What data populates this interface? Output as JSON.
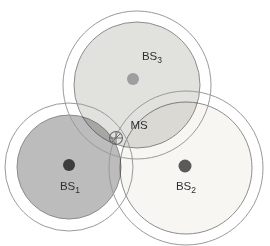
{
  "diagram": {
    "background": "#ffffff",
    "stations": [
      {
        "name": "BS1",
        "label_main": "BS",
        "label_sub": "1",
        "cx": 69,
        "cy": 167,
        "r_inner": 52,
        "r_outer": 64,
        "fill": "#bcbcbc",
        "dot": {
          "cx": 69,
          "cy": 165,
          "r": 6,
          "color": "#3d3d3d"
        },
        "label": {
          "x": 70,
          "y": 190
        }
      },
      {
        "name": "BS2",
        "label_main": "BS",
        "label_sub": "2",
        "cx": 186,
        "cy": 168,
        "r_inner": 66,
        "r_outer": 77,
        "fill": "#f7f6f3",
        "dot": {
          "cx": 185,
          "cy": 166,
          "r": 6.5,
          "color": "#5a5a5a"
        },
        "label": {
          "x": 186,
          "y": 190
        }
      },
      {
        "name": "BS3",
        "label_main": "BS",
        "label_sub": "3",
        "cx": 137,
        "cy": 85,
        "r_inner": 63,
        "r_outer": 74,
        "fill": "#e1e1de",
        "dot": {
          "cx": 133,
          "cy": 79,
          "r": 6,
          "color": "#9e9e9e"
        },
        "label": {
          "x": 152,
          "y": 60
        }
      }
    ],
    "mobile_station": {
      "label": "MS",
      "marker": {
        "cx": 116,
        "cy": 138,
        "r": 6.5,
        "color": "#6b6b6b"
      },
      "label_pos": {
        "x": 139,
        "y": 129
      }
    }
  }
}
